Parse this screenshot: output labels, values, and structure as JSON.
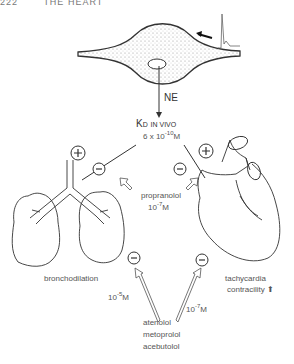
{
  "header": {
    "page_number": "222",
    "running_title": "THE HEART"
  },
  "nerve": {
    "transmitter_label": "NE"
  },
  "kd": {
    "title_main": "K",
    "title_sub": "D",
    "title_suffix": "IN VIVO",
    "value_prefix": "6 x 10",
    "value_exp": "-10",
    "value_unit": "M"
  },
  "signs": {
    "plus": "+",
    "minus": "−"
  },
  "propranolol": {
    "name": "propranolol",
    "conc_base": "10",
    "conc_exp": "-7",
    "conc_unit": "M"
  },
  "lungs": {
    "effect": "bronchodilation",
    "conc_base": "10",
    "conc_exp": "-5",
    "conc_unit": "M"
  },
  "heart": {
    "effect_1": "tachycardia",
    "effect_2": "contracility",
    "effect_2_arrow": "⬆"
  },
  "selective_blockers": {
    "drugs": [
      "atenolol",
      "metoprolol",
      "acebutolol"
    ],
    "heart_conc_base": "10",
    "heart_conc_exp": "-7",
    "heart_conc_unit": "M"
  }
}
